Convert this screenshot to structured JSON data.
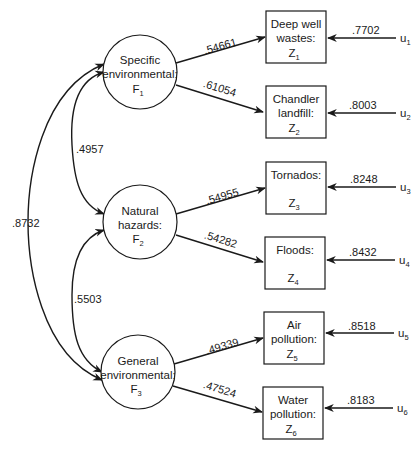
{
  "factors": [
    {
      "id": "F1",
      "line1": "Specific",
      "line2": "environmental:",
      "symbol": "F",
      "sub": "1"
    },
    {
      "id": "F2",
      "line1": "Natural",
      "line2": "hazards:",
      "symbol": "F",
      "sub": "2"
    },
    {
      "id": "F3",
      "line1": "General",
      "line2": "environmental:",
      "symbol": "F",
      "sub": "3"
    }
  ],
  "indicators": [
    {
      "id": "Z1",
      "line1": "Deep well",
      "line2": "wastes:",
      "symbol": "Z",
      "sub": "1",
      "loading": ".54661",
      "error": ".7702",
      "u": "u",
      "u_sub": "1"
    },
    {
      "id": "Z2",
      "line1": "Chandler",
      "line2": "landfill:",
      "symbol": "Z",
      "sub": "2",
      "loading": ".61054",
      "error": ".8003",
      "u": "u",
      "u_sub": "2"
    },
    {
      "id": "Z3",
      "line1": "Tornados:",
      "line2": "",
      "symbol": "Z",
      "sub": "3",
      "loading": ".54955",
      "error": ".8248",
      "u": "u",
      "u_sub": "3"
    },
    {
      "id": "Z4",
      "line1": "Floods:",
      "line2": "",
      "symbol": "Z",
      "sub": "4",
      "loading": ".54282",
      "error": ".8432",
      "u": "u",
      "u_sub": "4"
    },
    {
      "id": "Z5",
      "line1": "Air",
      "line2": "pollution:",
      "symbol": "Z",
      "sub": "5",
      "loading": ".49339",
      "error": ".8518",
      "u": "u",
      "u_sub": "5"
    },
    {
      "id": "Z6",
      "line1": "Water",
      "line2": "pollution:",
      "symbol": "Z",
      "sub": "6",
      "loading": ".47524",
      "error": ".8183",
      "u": "u",
      "u_sub": "6"
    }
  ],
  "correlations": {
    "F1_F2": ".4957",
    "F2_F3": ".5503",
    "F1_F3": ".8732"
  }
}
